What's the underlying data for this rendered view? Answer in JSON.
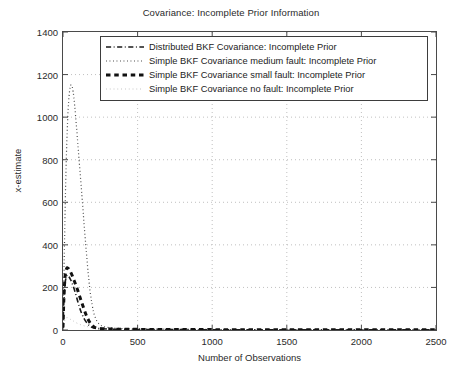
{
  "chart_data": {
    "type": "line",
    "title": "Covariance: Incomplete Prior Information",
    "xlabel": "Number of Observations",
    "ylabel": "x-estimate",
    "xlim": [
      0,
      2500
    ],
    "ylim": [
      0,
      1400
    ],
    "xticks": [
      0,
      500,
      1000,
      1500,
      2000,
      2500
    ],
    "yticks": [
      0,
      200,
      400,
      600,
      800,
      1000,
      1200,
      1400
    ],
    "grid": true,
    "legend_position": "upper center",
    "series": [
      {
        "name": "Distributed BKF Covariance: Incomplete Prior",
        "style": "dash-dot",
        "color": "#1a1a1a",
        "width": 1.6,
        "x": [
          0,
          5,
          12,
          20,
          30,
          40,
          52,
          64,
          76,
          88,
          100,
          112,
          125,
          140,
          155,
          170,
          185,
          200,
          250,
          400,
          700,
          1200,
          1800,
          2500
        ],
        "y": [
          10,
          120,
          205,
          245,
          258,
          250,
          235,
          215,
          190,
          162,
          132,
          104,
          78,
          55,
          38,
          25,
          16,
          11,
          6,
          3,
          2,
          1,
          1,
          1
        ]
      },
      {
        "name": "Simple BKF Covariance medium fault: Incomplete Prior",
        "style": "dotted",
        "color": "#3a3a3a",
        "width": 1.2,
        "x": [
          0,
          8,
          18,
          28,
          38,
          48,
          58,
          68,
          78,
          90,
          102,
          115,
          128,
          140,
          152,
          162,
          172,
          182,
          195,
          210,
          240,
          300,
          450,
          800,
          1400,
          2000,
          2500
        ],
        "y": [
          15,
          330,
          690,
          930,
          1075,
          1140,
          1150,
          1120,
          1055,
          960,
          850,
          735,
          620,
          510,
          405,
          320,
          245,
          180,
          120,
          72,
          30,
          12,
          6,
          3,
          2,
          1,
          1
        ]
      },
      {
        "name": "Simple BKF Covariance small fault: Incomplete Prior",
        "style": "dashed-thick",
        "color": "#111111",
        "width": 3.0,
        "x": [
          0,
          6,
          14,
          24,
          34,
          46,
          58,
          70,
          84,
          98,
          112,
          126,
          140,
          152,
          164,
          176,
          188,
          205,
          230,
          300,
          500,
          900,
          1500,
          2100,
          2500
        ],
        "y": [
          12,
          150,
          252,
          288,
          290,
          278,
          262,
          240,
          215,
          188,
          158,
          128,
          100,
          76,
          56,
          40,
          27,
          16,
          9,
          5,
          3,
          2,
          1,
          1,
          1
        ]
      },
      {
        "name": "Simple BKF Covariance no fault: Incomplete Prior",
        "style": "dotted-faint",
        "color": "#b8b8b8",
        "width": 1.0,
        "x": [
          0,
          10,
          25,
          45,
          70,
          100,
          140,
          185,
          240,
          320,
          450,
          700,
          1100,
          1600,
          2100,
          2500
        ],
        "y": [
          8,
          42,
          58,
          52,
          42,
          30,
          20,
          13,
          9,
          6,
          4,
          3,
          2,
          2,
          1,
          1
        ]
      }
    ]
  },
  "axes": {
    "yticks_labels": [
      "0",
      "200",
      "400",
      "600",
      "800",
      "1000",
      "1200",
      "1400"
    ],
    "xticks_labels": [
      "0",
      "500",
      "1000",
      "1500",
      "2000",
      "2500"
    ]
  },
  "legend": {
    "items": [
      {
        "label": "Distributed BKF Covariance: Incomplete Prior",
        "style": "dash-dot"
      },
      {
        "label": "Simple BKF Covariance medium fault: Incomplete Prior",
        "style": "dotted"
      },
      {
        "label": "Simple BKF Covariance small fault: Incomplete Prior",
        "style": "dashed-thick"
      },
      {
        "label": "Simple BKF Covariance no fault: Incomplete Prior",
        "style": "dotted-faint"
      }
    ]
  }
}
